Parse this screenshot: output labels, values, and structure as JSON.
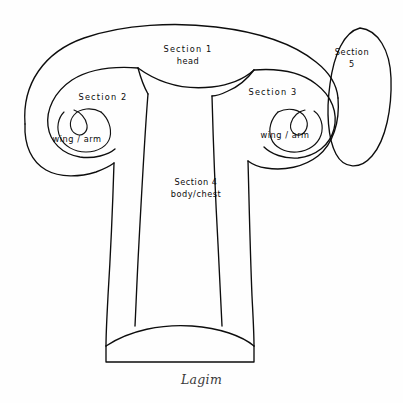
{
  "figure": {
    "caption": "Lagim",
    "background_color": "#fefefe",
    "line_color": "#0d0d0d"
  },
  "labels": {
    "section1": {
      "title": "Section 1",
      "subtitle": "head"
    },
    "section2": {
      "title": "Section 2",
      "subtitle": "wing / arm"
    },
    "section3": {
      "title": "Section 3",
      "subtitle": "wing / arm"
    },
    "section4": {
      "title": "Section 4",
      "subtitle": "body/chest"
    },
    "section5": {
      "title": "Section",
      "subtitle": "5"
    }
  }
}
